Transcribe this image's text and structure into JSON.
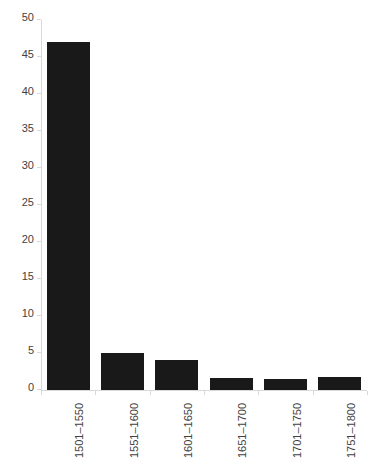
{
  "chart_data": {
    "type": "bar",
    "title": "",
    "subtitle": "",
    "xlabel": "",
    "ylabel": "",
    "categories": [
      "1501–1550",
      "1551–1600",
      "1601–1650",
      "1651–1700",
      "1701–1750",
      "1751–1800"
    ],
    "values": [
      47,
      5,
      4,
      1.6,
      1.5,
      1.8
    ],
    "ylim": [
      0,
      50
    ],
    "ytick_labels": [
      "0",
      "5",
      "10",
      "15",
      "20",
      "25",
      "30",
      "35",
      "40",
      "45",
      "50"
    ],
    "ytick_values": [
      0,
      5,
      10,
      15,
      20,
      25,
      30,
      35,
      40,
      45,
      50
    ],
    "grid": false,
    "legend": false,
    "legend_position": "none",
    "bar_color": "#191919",
    "axis_color": "#d9d9d9",
    "tick_label_color": "#3f3f3f",
    "background_color": "#ffffff",
    "xtick_label_rotation": -90
  }
}
